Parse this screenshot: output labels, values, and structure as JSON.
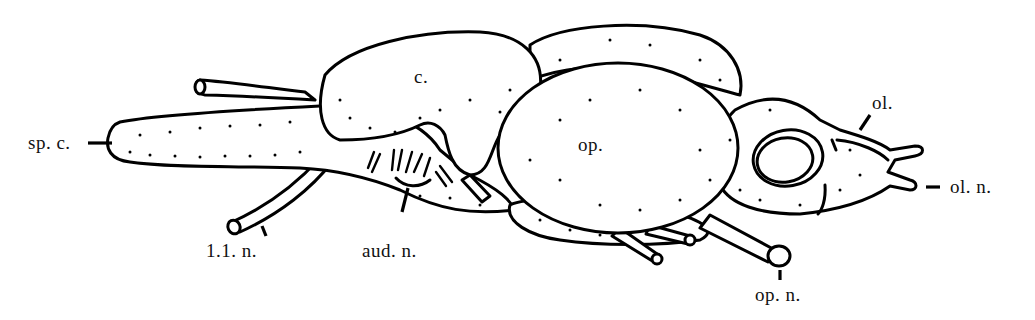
{
  "figure": {
    "labels": {
      "spinal_cord": "sp. c.",
      "cerebellum": "c.",
      "optic_lobe": "op.",
      "olfactory_lobe": "ol.",
      "olfactory_nerve": "ol. n.",
      "lateral_line_nerve": "1.1. n.",
      "auditory_nerve": "aud. n.",
      "optic_nerve": "op. n."
    },
    "colors": {
      "ink": "#000000",
      "background": "#ffffff"
    }
  }
}
